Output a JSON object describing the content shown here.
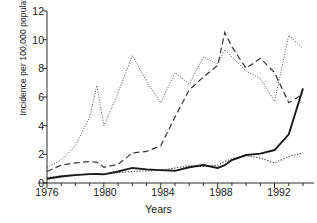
{
  "chart_data": {
    "type": "line",
    "title": "",
    "xlabel": "Years",
    "ylabel": "Incidence per 100,000 population",
    "xlim": [
      1976,
      1994
    ],
    "ylim": [
      0,
      12
    ],
    "xticks": [
      1976,
      1980,
      1984,
      1988,
      1992
    ],
    "xtick_labels": [
      "1976",
      "1980",
      "1984",
      "1988",
      "1992"
    ],
    "xminor_step": 1,
    "yticks": [
      0,
      2,
      4,
      6,
      8,
      10,
      12
    ],
    "ytick_labels": [
      "0",
      "2",
      "4",
      "6",
      "8",
      "10",
      "12"
    ],
    "grid": false,
    "legend": "none",
    "x": [
      1976,
      1977,
      1978,
      1979,
      1979.5,
      1980,
      1981,
      1982,
      1983,
      1984,
      1985,
      1986,
      1987,
      1988,
      1988.5,
      1989,
      1990,
      1991,
      1992,
      1993,
      1994
    ],
    "series": [
      {
        "name": "series-thin-dotted-high",
        "style": "dotted-thin",
        "color": "#555555",
        "values": [
          1.1,
          1.6,
          2.6,
          4.6,
          6.8,
          4.0,
          6.3,
          8.9,
          7.1,
          5.6,
          7.7,
          6.9,
          8.8,
          8.3,
          9.3,
          8.8,
          7.8,
          7.3,
          5.7,
          10.3,
          9.4
        ]
      },
      {
        "name": "series-dashed",
        "style": "dashed",
        "color": "#3a3a3a",
        "values": [
          0.8,
          1.25,
          1.4,
          1.5,
          1.45,
          1.1,
          1.3,
          2.1,
          2.2,
          2.6,
          4.6,
          6.5,
          7.4,
          8.2,
          10.5,
          9.5,
          8.0,
          8.7,
          7.7,
          5.6,
          6.2
        ]
      },
      {
        "name": "series-dotted-low",
        "style": "dotted",
        "color": "#4a4a4a",
        "values": [
          0.38,
          0.5,
          0.6,
          0.62,
          0.63,
          0.6,
          0.72,
          0.8,
          0.85,
          0.9,
          1.05,
          1.2,
          1.15,
          1.25,
          1.5,
          1.7,
          1.9,
          1.75,
          1.4,
          1.85,
          2.1
        ]
      },
      {
        "name": "series-solid",
        "style": "solid",
        "color": "#1a1a1a",
        "values": [
          0.3,
          0.45,
          0.55,
          0.62,
          0.63,
          0.6,
          0.8,
          1.05,
          0.95,
          0.9,
          0.85,
          1.1,
          1.25,
          1.05,
          1.25,
          1.6,
          1.95,
          2.05,
          2.3,
          3.4,
          6.6
        ]
      }
    ]
  }
}
